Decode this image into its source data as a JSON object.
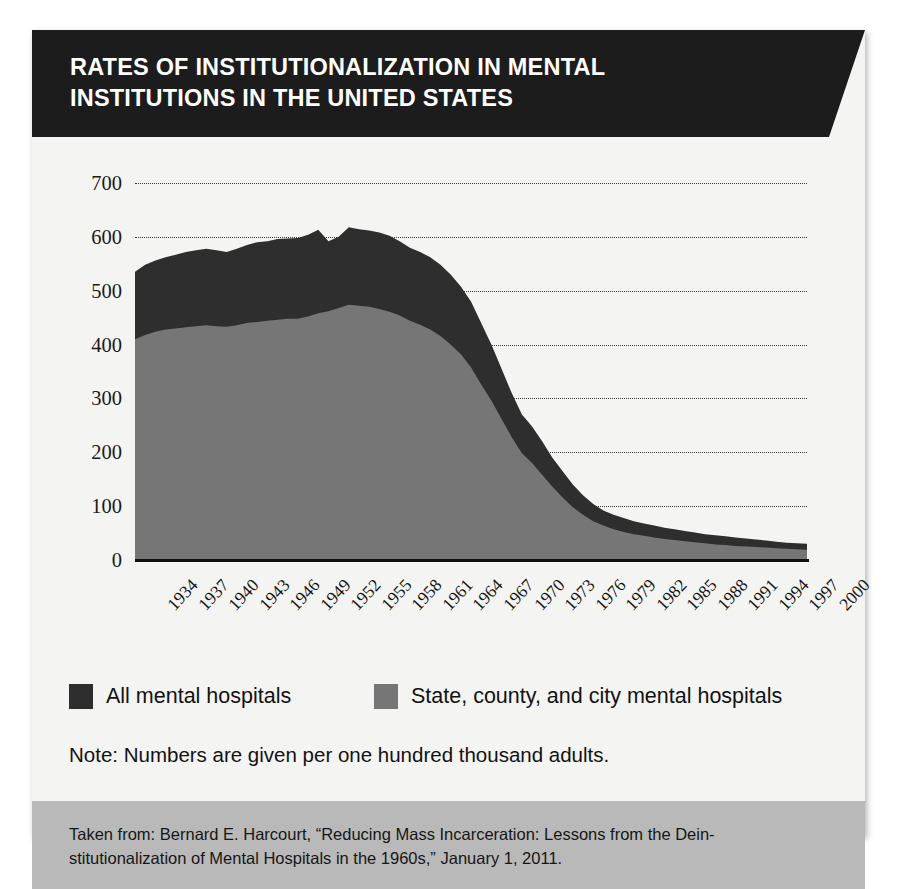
{
  "figure": {
    "title_line1": "Rates of institutionalization in mental",
    "title_line2": "institutions in the United States",
    "note": "Note: Numbers are given per one hundred thousand adults.",
    "source": "Taken from: Bernard E. Harcourt, “Reducing Mass Incarceration: Lessons from the Dein-stitutionalization of Mental Hospitals in the 1960s,” January 1, 2011."
  },
  "colors": {
    "series_all": "#2e2e2e",
    "series_state": "#767676",
    "banner": "#1c1c1c",
    "page": "#f4f4f2",
    "source_bar": "#b9b9b9",
    "gridline": "#3a3a3a",
    "baseline": "#111111"
  },
  "chart_data": {
    "type": "area",
    "title": "Rates of institutionalization in mental institutions in the United States",
    "subtitle": "",
    "xlabel": "",
    "ylabel": "",
    "ylim": [
      0,
      700
    ],
    "yticks": [
      0,
      100,
      200,
      300,
      400,
      500,
      600,
      700
    ],
    "ytick_labels": [
      "0",
      "100",
      "200",
      "300",
      "400",
      "500",
      "600",
      "700"
    ],
    "grid": true,
    "grid_axis": "y",
    "legend_position": "below-plot",
    "stacked": false,
    "annotation": "Note: Numbers are given per one hundred thousand adults.",
    "xtick_labels": [
      "1934",
      "1937",
      "1940",
      "1943",
      "1946",
      "1949",
      "1952",
      "1955",
      "1958",
      "1961",
      "1964",
      "1967",
      "1970",
      "1973",
      "1976",
      "1979",
      "1982",
      "1985",
      "1988",
      "1991",
      "1994",
      "1997",
      "2000"
    ],
    "x": [
      1934,
      1935,
      1936,
      1937,
      1938,
      1939,
      1940,
      1941,
      1942,
      1943,
      1944,
      1945,
      1946,
      1947,
      1948,
      1949,
      1950,
      1951,
      1952,
      1953,
      1954,
      1955,
      1956,
      1957,
      1958,
      1959,
      1960,
      1961,
      1962,
      1963,
      1964,
      1965,
      1966,
      1967,
      1968,
      1969,
      1970,
      1971,
      1972,
      1973,
      1974,
      1975,
      1976,
      1977,
      1978,
      1979,
      1980,
      1981,
      1982,
      1983,
      1984,
      1985,
      1986,
      1987,
      1988,
      1989,
      1990,
      1991,
      1992,
      1993,
      1994,
      1995,
      1996,
      1997,
      1998,
      1999,
      2000
    ],
    "series": [
      {
        "name": "All mental hospitals",
        "color": "#2e2e2e",
        "values": [
          535,
          548,
          556,
          562,
          567,
          572,
          575,
          578,
          575,
          572,
          578,
          585,
          590,
          592,
          596,
          597,
          598,
          604,
          613,
          592,
          600,
          618,
          614,
          612,
          608,
          602,
          592,
          580,
          572,
          562,
          548,
          530,
          508,
          480,
          440,
          400,
          355,
          310,
          270,
          248,
          220,
          190,
          165,
          140,
          120,
          104,
          92,
          84,
          78,
          72,
          68,
          64,
          60,
          57,
          54,
          51,
          48,
          46,
          44,
          42,
          40,
          38,
          36,
          34,
          32,
          31,
          30
        ]
      },
      {
        "name": "State, county, and city mental hospitals",
        "color": "#767676",
        "values": [
          410,
          418,
          424,
          428,
          430,
          432,
          434,
          436,
          434,
          433,
          436,
          440,
          442,
          444,
          446,
          448,
          448,
          452,
          458,
          462,
          468,
          474,
          472,
          470,
          466,
          461,
          454,
          444,
          437,
          428,
          416,
          400,
          382,
          358,
          326,
          296,
          262,
          228,
          198,
          180,
          158,
          136,
          116,
          98,
          84,
          72,
          64,
          57,
          52,
          48,
          45,
          42,
          39,
          37,
          35,
          33,
          31,
          29,
          28,
          26,
          25,
          24,
          23,
          22,
          21,
          20,
          19
        ]
      }
    ],
    "legend": [
      {
        "label": "All mental hospitals",
        "color": "#2e2e2e"
      },
      {
        "label": "State, county, and city mental hospitals",
        "color": "#767676"
      }
    ]
  }
}
